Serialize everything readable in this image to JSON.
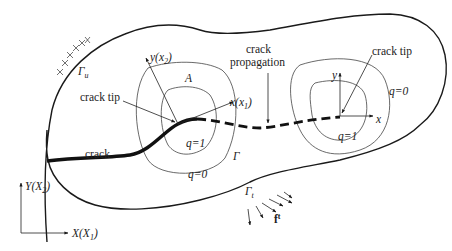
{
  "diagram": {
    "type": "crack propagation domain with J-integral contours",
    "labels": {
      "gamma_u": "Γ",
      "gamma_u_sub": "u",
      "crack_tip_left": "crack tip",
      "crack_tip_right": "crack tip",
      "crack_propagation_line1": "crack",
      "crack_propagation_line2": "propagation",
      "crack": "crack",
      "area_A": "A",
      "local_y": "y(x",
      "local_y_sub": "2",
      "local_x": "x(x",
      "local_x_sub": "1",
      "close_paren": ")",
      "q1_left": "q=1",
      "q0_left": "q=0",
      "gamma": "Γ",
      "q1_right": "q=1",
      "q0_right": "q=0",
      "right_y": "y",
      "right_x": "x",
      "gamma_t": "Γ",
      "gamma_t_sub": "t",
      "traction": "f",
      "traction_sup": "t",
      "global_Y": "Y(X",
      "global_Y_sub": "2",
      "global_X": "X(X",
      "global_X_sub": "1"
    },
    "colors": {
      "stroke": "#1a1a1a",
      "contour": "#444444",
      "background": "#ffffff"
    }
  }
}
